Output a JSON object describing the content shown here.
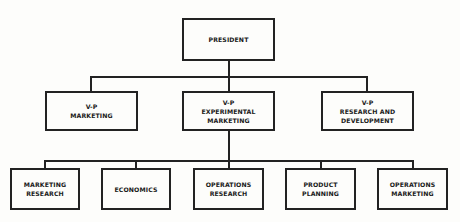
{
  "diagram": {
    "type": "org-chart",
    "president": {
      "lines": [
        "PRESIDENT"
      ]
    },
    "vice_presidents": [
      {
        "lines": [
          "V-P",
          "MARKETING"
        ]
      },
      {
        "lines": [
          "V-P",
          "EXPERIMENTAL",
          "MARKETING"
        ]
      },
      {
        "lines": [
          "V-P",
          "RESEARCH AND",
          "DEVELOPMENT"
        ]
      }
    ],
    "departments": [
      {
        "lines": [
          "MARKETING",
          "RESEARCH"
        ]
      },
      {
        "lines": [
          "ECONOMICS"
        ]
      },
      {
        "lines": [
          "OPERATIONS",
          "RESEARCH"
        ]
      },
      {
        "lines": [
          "PRODUCT",
          "PLANNING"
        ]
      },
      {
        "lines": [
          "OPERATIONS",
          "MARKETING"
        ]
      }
    ],
    "departments_report_to": "V-P EXPERIMENTAL MARKETING"
  }
}
